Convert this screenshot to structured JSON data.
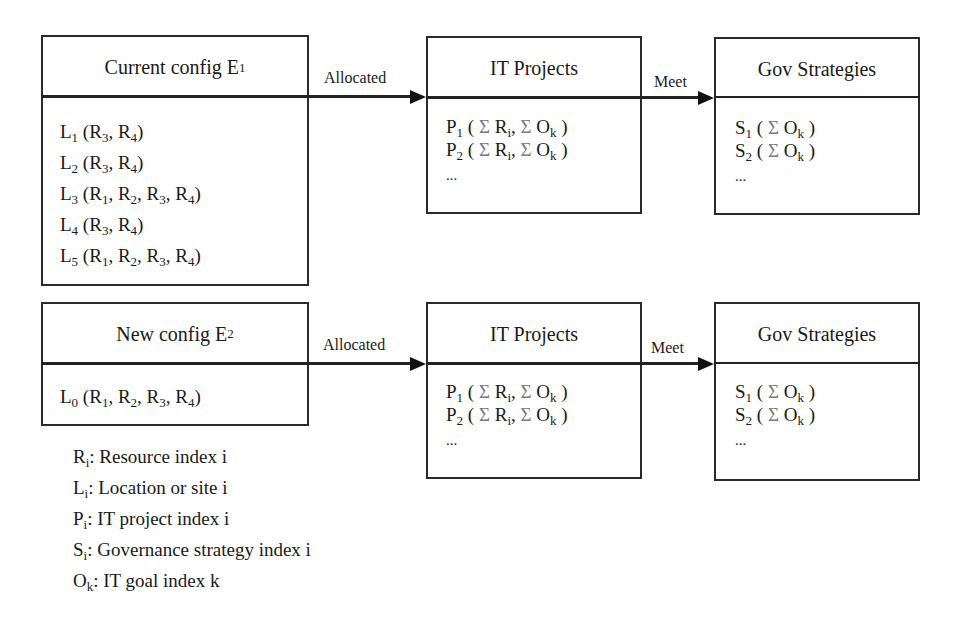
{
  "diagram": {
    "rows": [
      {
        "config": {
          "title": "Current config E",
          "title_sub": "1",
          "locations": [
            {
              "name": "L",
              "sub": "1",
              "resources": [
                [
                  "R",
                  "3"
                ],
                [
                  "R",
                  "4"
                ]
              ]
            },
            {
              "name": "L",
              "sub": "2",
              "resources": [
                [
                  "R",
                  "3"
                ],
                [
                  "R",
                  "4"
                ]
              ]
            },
            {
              "name": "L",
              "sub": "3",
              "resources": [
                [
                  "R",
                  "1"
                ],
                [
                  "R",
                  "2"
                ],
                [
                  "R",
                  "3"
                ],
                [
                  "R",
                  "4"
                ]
              ]
            },
            {
              "name": "L",
              "sub": "4",
              "resources": [
                [
                  "R",
                  "3"
                ],
                [
                  "R",
                  "4"
                ]
              ]
            },
            {
              "name": "L",
              "sub": "5",
              "resources": [
                [
                  "R",
                  "1"
                ],
                [
                  "R",
                  "2"
                ],
                [
                  "R",
                  "3"
                ],
                [
                  "R",
                  "4"
                ]
              ]
            }
          ]
        },
        "edge1_label": "Allocated",
        "projects": {
          "title": "IT Projects",
          "items": [
            {
              "name": "P",
              "sub": "1"
            },
            {
              "name": "P",
              "sub": "2"
            }
          ],
          "ellipsis": "..."
        },
        "edge2_label": "Meet",
        "strategies": {
          "title": "Gov Strategies",
          "items": [
            {
              "name": "S",
              "sub": "1"
            },
            {
              "name": "S",
              "sub": "2"
            }
          ],
          "ellipsis": "..."
        }
      },
      {
        "config": {
          "title": "New config E",
          "title_sub": "2",
          "locations": [
            {
              "name": "L",
              "sub": "0",
              "resources": [
                [
                  "R",
                  "1"
                ],
                [
                  "R",
                  "2"
                ],
                [
                  "R",
                  "3"
                ],
                [
                  "R",
                  "4"
                ]
              ]
            }
          ]
        },
        "edge1_label": "Allocated",
        "projects": {
          "title": "IT Projects",
          "items": [
            {
              "name": "P",
              "sub": "1"
            },
            {
              "name": "P",
              "sub": "2"
            }
          ],
          "ellipsis": "..."
        },
        "edge2_label": "Meet",
        "strategies": {
          "title": "Gov Strategies",
          "items": [
            {
              "name": "S",
              "sub": "1"
            },
            {
              "name": "S",
              "sub": "2"
            }
          ],
          "ellipsis": "..."
        }
      }
    ],
    "sum_symbol": "Σ",
    "project_terms": [
      [
        "R",
        "i"
      ],
      [
        "O",
        "k"
      ]
    ],
    "strategy_terms": [
      [
        "O",
        "k"
      ]
    ]
  },
  "legend": [
    {
      "symbol": "R",
      "sub": "i",
      "text": ": Resource index i"
    },
    {
      "symbol": "L",
      "sub": "i",
      "text": ": Location or site i"
    },
    {
      "symbol": "P",
      "sub": "i",
      "text": ": IT project index i"
    },
    {
      "symbol": "S",
      "sub": "i",
      "text": ": Governance strategy index i"
    },
    {
      "symbol": "O",
      "sub": "k",
      "text": ": IT goal index k"
    }
  ],
  "colors": {
    "line": "#222222",
    "text": "#1a1a1a",
    "sigma": "#7a7a7a"
  }
}
